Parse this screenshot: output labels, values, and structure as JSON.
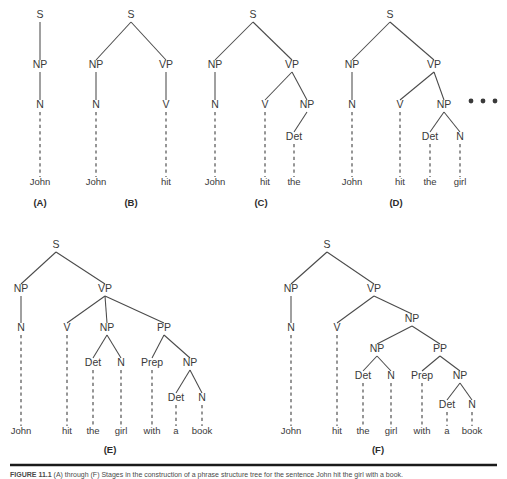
{
  "figure": {
    "caption_prefix": "FIGURE 11.1",
    "caption_text": "(A) through (F) Stages in the construction of a phrase structure tree for the sentence John hit the girl with a book.",
    "panels": [
      {
        "id": "A",
        "label": "(A)",
        "nodes": [
          {
            "name": "S",
            "x": 40,
            "y": 18
          },
          {
            "name": "NP",
            "x": 40,
            "y": 68
          },
          {
            "name": "N",
            "x": 40,
            "y": 108
          }
        ],
        "leaves": [
          {
            "word": "John",
            "x": 40,
            "y": 185
          }
        ]
      },
      {
        "id": "B",
        "label": "(B)",
        "nodes": [
          {
            "name": "S",
            "x": 131,
            "y": 18
          },
          {
            "name": "NP",
            "x": 96,
            "y": 68
          },
          {
            "name": "VP",
            "x": 166,
            "y": 68
          },
          {
            "name": "N",
            "x": 96,
            "y": 108
          },
          {
            "name": "V",
            "x": 166,
            "y": 108
          }
        ],
        "leaves": [
          {
            "word": "John",
            "x": 96,
            "y": 185
          },
          {
            "word": "hit",
            "x": 166,
            "y": 185
          }
        ]
      },
      {
        "id": "C",
        "label": "(C)",
        "nodes": [
          {
            "name": "S",
            "x": 253,
            "y": 18
          },
          {
            "name": "NP",
            "x": 215,
            "y": 68
          },
          {
            "name": "VP",
            "x": 292,
            "y": 68
          },
          {
            "name": "N",
            "x": 215,
            "y": 108
          },
          {
            "name": "V",
            "x": 265,
            "y": 108
          },
          {
            "name": "NP",
            "x": 307,
            "y": 108
          },
          {
            "name": "Det",
            "x": 294,
            "y": 140
          }
        ],
        "leaves": [
          {
            "word": "John",
            "x": 215,
            "y": 185
          },
          {
            "word": "hit",
            "x": 265,
            "y": 185
          },
          {
            "word": "the",
            "x": 294,
            "y": 185
          }
        ]
      },
      {
        "id": "D",
        "label": "(D)",
        "nodes": [
          {
            "name": "S",
            "x": 390,
            "y": 18
          },
          {
            "name": "NP",
            "x": 352,
            "y": 68
          },
          {
            "name": "VP",
            "x": 434,
            "y": 68
          },
          {
            "name": "N",
            "x": 352,
            "y": 108
          },
          {
            "name": "V",
            "x": 400,
            "y": 108
          },
          {
            "name": "NP",
            "x": 444,
            "y": 108
          },
          {
            "name": "Det",
            "x": 430,
            "y": 140
          },
          {
            "name": "N",
            "x": 460,
            "y": 140
          }
        ],
        "leaves": [
          {
            "word": "John",
            "x": 352,
            "y": 185
          },
          {
            "word": "hit",
            "x": 400,
            "y": 185
          },
          {
            "word": "the",
            "x": 430,
            "y": 185
          },
          {
            "word": "girl",
            "x": 460,
            "y": 185
          }
        ],
        "ellipsis": [
          {
            "x": 471,
            "y": 101
          },
          {
            "x": 483,
            "y": 101
          },
          {
            "x": 495,
            "y": 101
          }
        ]
      },
      {
        "id": "E",
        "label": "(E)",
        "nodes": [
          {
            "name": "S",
            "x": 56,
            "y": 248
          },
          {
            "name": "NP",
            "x": 21,
            "y": 292
          },
          {
            "name": "VP",
            "x": 105,
            "y": 292
          },
          {
            "name": "N",
            "x": 21,
            "y": 331
          },
          {
            "name": "V",
            "x": 67,
            "y": 331
          },
          {
            "name": "NP",
            "x": 107,
            "y": 331
          },
          {
            "name": "PP",
            "x": 164,
            "y": 331
          },
          {
            "name": "Det",
            "x": 93,
            "y": 366
          },
          {
            "name": "N",
            "x": 121,
            "y": 366
          },
          {
            "name": "Prep",
            "x": 152,
            "y": 366
          },
          {
            "name": "NP",
            "x": 190,
            "y": 366
          },
          {
            "name": "Det",
            "x": 176,
            "y": 401
          },
          {
            "name": "N",
            "x": 202,
            "y": 401
          }
        ],
        "leaves": [
          {
            "word": "John",
            "x": 21,
            "y": 434
          },
          {
            "word": "hit",
            "x": 67,
            "y": 434
          },
          {
            "word": "the",
            "x": 93,
            "y": 434
          },
          {
            "word": "girl",
            "x": 121,
            "y": 434
          },
          {
            "word": "with",
            "x": 152,
            "y": 434
          },
          {
            "word": "a",
            "x": 176,
            "y": 434
          },
          {
            "word": "book",
            "x": 202,
            "y": 434
          }
        ]
      },
      {
        "id": "F",
        "label": "(F)",
        "nodes": [
          {
            "name": "S",
            "x": 327,
            "y": 248
          },
          {
            "name": "NP",
            "x": 291,
            "y": 292
          },
          {
            "name": "VP",
            "x": 374,
            "y": 292
          },
          {
            "name": "N",
            "x": 291,
            "y": 331
          },
          {
            "name": "V",
            "x": 337,
            "y": 331
          },
          {
            "name": "NP",
            "x": 412,
            "y": 322
          },
          {
            "name": "NP",
            "x": 377,
            "y": 352
          },
          {
            "name": "PP",
            "x": 440,
            "y": 352
          },
          {
            "name": "Det",
            "x": 363,
            "y": 379
          },
          {
            "name": "N",
            "x": 391,
            "y": 379
          },
          {
            "name": "Prep",
            "x": 422,
            "y": 379
          },
          {
            "name": "NP",
            "x": 460,
            "y": 379
          },
          {
            "name": "Det",
            "x": 447,
            "y": 408
          },
          {
            "name": "N",
            "x": 472,
            "y": 408
          }
        ],
        "leaves": [
          {
            "word": "John",
            "x": 291,
            "y": 434
          },
          {
            "word": "hit",
            "x": 337,
            "y": 434
          },
          {
            "word": "the",
            "x": 363,
            "y": 434
          },
          {
            "word": "girl",
            "x": 391,
            "y": 434
          },
          {
            "word": "with",
            "x": 422,
            "y": 434
          },
          {
            "word": "a",
            "x": 447,
            "y": 434
          },
          {
            "word": "book",
            "x": 472,
            "y": 434
          }
        ]
      }
    ],
    "panel_labels": [
      {
        "text": "(A)",
        "x": 40,
        "y": 206
      },
      {
        "text": "(B)",
        "x": 131,
        "y": 206
      },
      {
        "text": "(C)",
        "x": 261,
        "y": 206
      },
      {
        "text": "(D)",
        "x": 396,
        "y": 206
      },
      {
        "text": "(E)",
        "x": 110,
        "y": 453
      },
      {
        "text": "(F)",
        "x": 378,
        "y": 453
      }
    ],
    "colors": {
      "ink": "#3a3a3a",
      "line": "#4a4a4a",
      "rule": "#1a1a1a",
      "background": "#ffffff"
    }
  }
}
